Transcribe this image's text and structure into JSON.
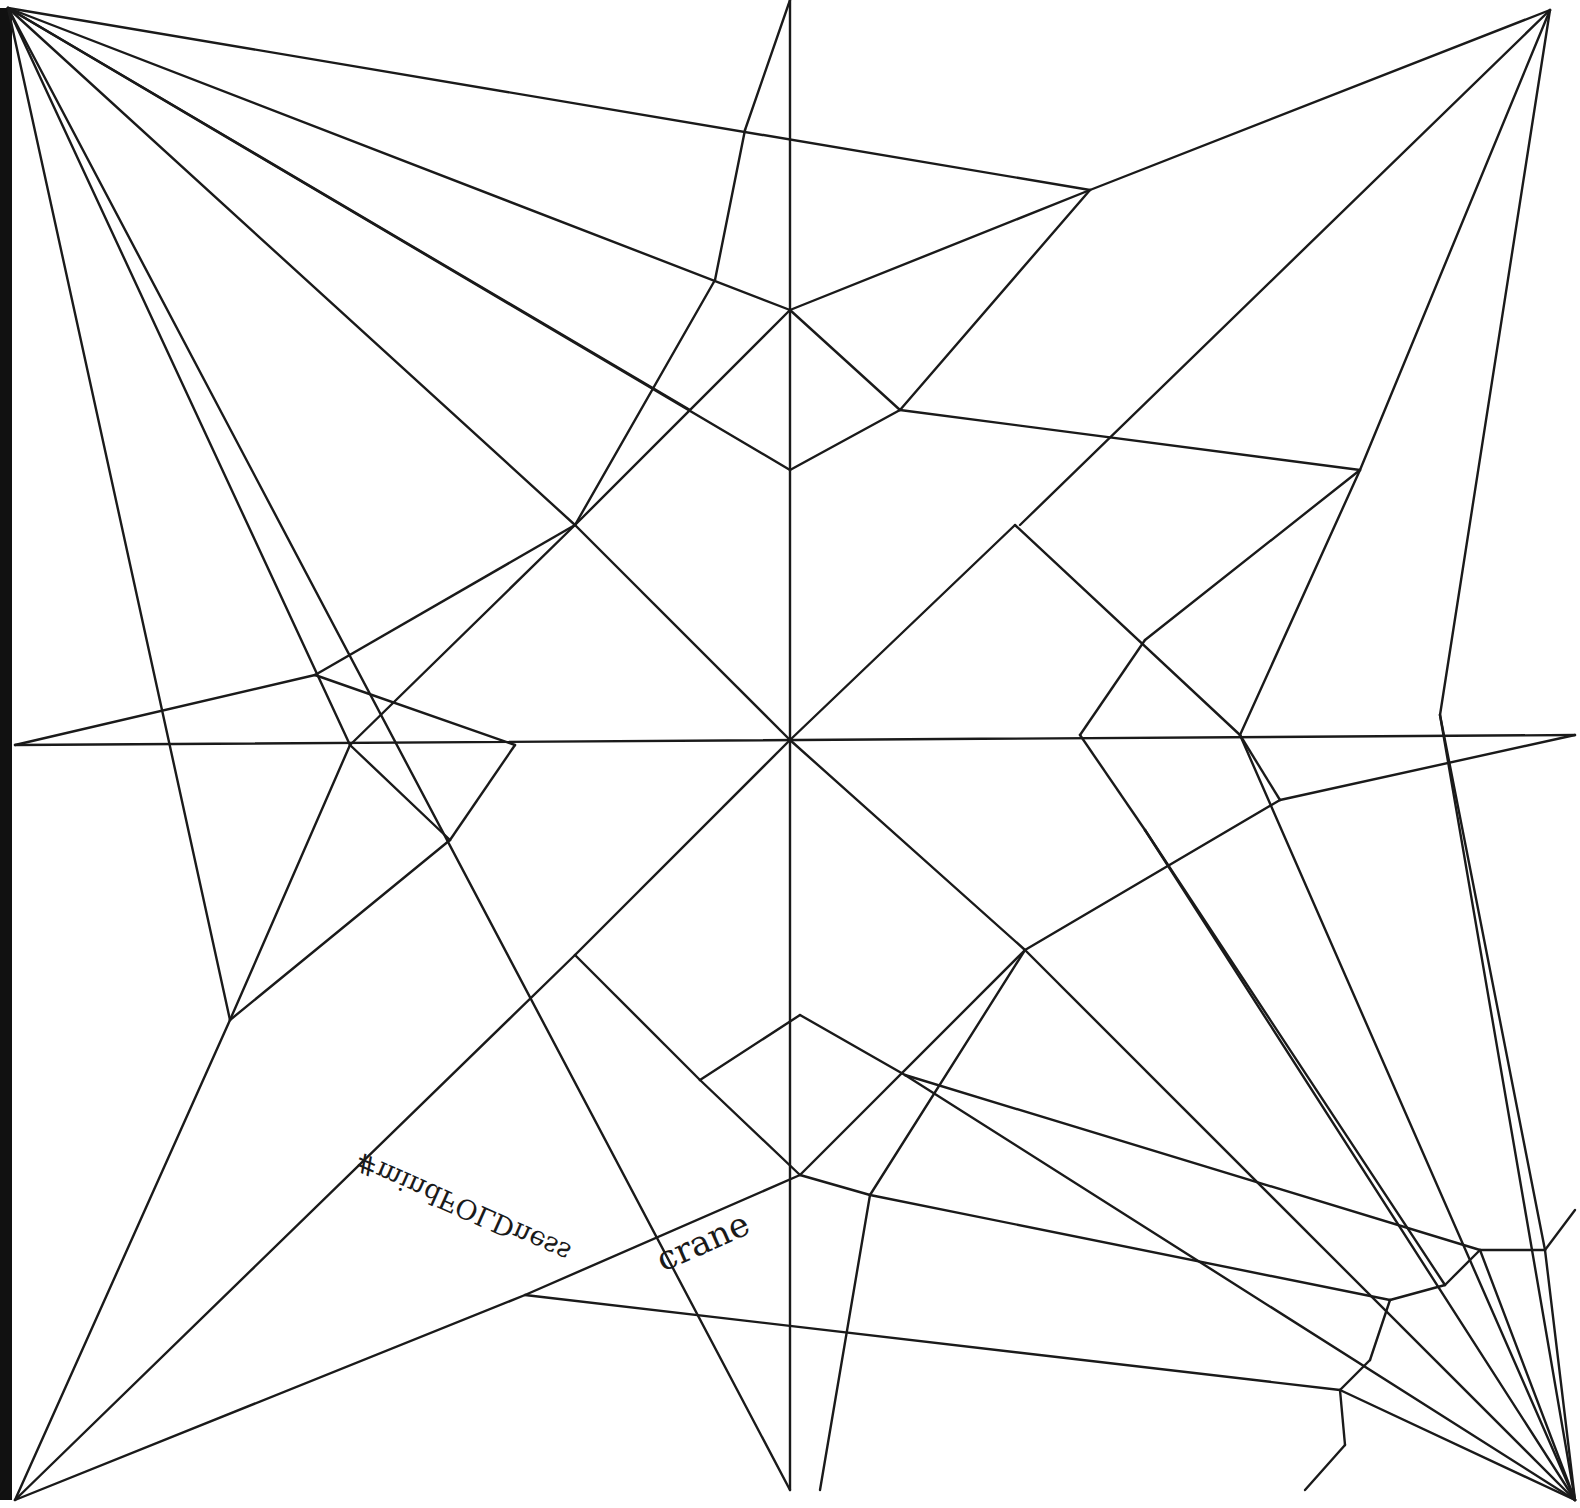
{
  "diagram": {
    "type": "origami-crease-pattern",
    "subject": "crane",
    "labels": {
      "hashtag": "#mindFOLDness",
      "model_name": "crane"
    },
    "colors": {
      "line": "#1a1a1a",
      "background": "#ffffff",
      "edge": "#111111"
    },
    "segments": [
      [
        8,
        8,
        790,
        1490
      ],
      [
        790,
        1490,
        790,
        0
      ],
      [
        8,
        8,
        1090,
        190
      ],
      [
        1090,
        190,
        1550,
        10
      ],
      [
        8,
        8,
        790,
        310
      ],
      [
        8,
        8,
        575,
        525
      ],
      [
        8,
        8,
        230,
        1020
      ],
      [
        8,
        8,
        350,
        745
      ],
      [
        8,
        8,
        690,
        410
      ],
      [
        8,
        8,
        790,
        470
      ],
      [
        790,
        0,
        745,
        130
      ],
      [
        745,
        130,
        715,
        280
      ],
      [
        715,
        280,
        575,
        525
      ],
      [
        575,
        525,
        315,
        675
      ],
      [
        315,
        675,
        15,
        745
      ],
      [
        1090,
        190,
        790,
        310
      ],
      [
        1090,
        190,
        900,
        410
      ],
      [
        790,
        310,
        575,
        525
      ],
      [
        790,
        310,
        900,
        410
      ],
      [
        790,
        470,
        900,
        410
      ],
      [
        900,
        410,
        1360,
        470
      ],
      [
        1550,
        10,
        1020,
        525
      ],
      [
        1550,
        10,
        1360,
        470
      ],
      [
        1550,
        10,
        1440,
        715
      ],
      [
        15,
        745,
        1575,
        735
      ],
      [
        575,
        525,
        790,
        740
      ],
      [
        790,
        740,
        1015,
        525
      ],
      [
        1015,
        525,
        1240,
        735
      ],
      [
        350,
        745,
        575,
        525
      ],
      [
        350,
        745,
        450,
        840
      ],
      [
        450,
        840,
        515,
        745
      ],
      [
        515,
        745,
        315,
        675
      ],
      [
        350,
        745,
        230,
        1020
      ],
      [
        230,
        1020,
        450,
        840
      ],
      [
        790,
        740,
        575,
        955
      ],
      [
        790,
        740,
        1025,
        950
      ],
      [
        1360,
        470,
        1145,
        640
      ],
      [
        1145,
        640,
        1080,
        735
      ],
      [
        1080,
        735,
        1145,
        830
      ],
      [
        1360,
        470,
        1240,
        735
      ],
      [
        1240,
        735,
        1280,
        800
      ],
      [
        1280,
        800,
        1575,
        735
      ],
      [
        1280,
        800,
        1025,
        950
      ],
      [
        1025,
        950,
        870,
        1195
      ],
      [
        870,
        1195,
        820,
        1490
      ],
      [
        1440,
        715,
        1545,
        1250
      ],
      [
        1545,
        1250,
        1575,
        1210
      ],
      [
        1145,
        830,
        1445,
        1285
      ],
      [
        1445,
        1285,
        1480,
        1250
      ],
      [
        1480,
        1250,
        1545,
        1250
      ],
      [
        230,
        1020,
        15,
        1500
      ],
      [
        15,
        1500,
        525,
        1295
      ],
      [
        525,
        1295,
        800,
        1175
      ],
      [
        15,
        1500,
        575,
        955
      ],
      [
        575,
        955,
        700,
        1080
      ],
      [
        700,
        1080,
        800,
        1015
      ],
      [
        800,
        1015,
        905,
        1075
      ],
      [
        700,
        1080,
        800,
        1175
      ],
      [
        800,
        1175,
        1025,
        950
      ],
      [
        800,
        1175,
        870,
        1195
      ],
      [
        870,
        1195,
        1390,
        1300
      ],
      [
        525,
        1295,
        1340,
        1390
      ],
      [
        1340,
        1390,
        1575,
        1500
      ],
      [
        905,
        1075,
        1575,
        1500
      ],
      [
        1025,
        950,
        1575,
        1500
      ],
      [
        1145,
        830,
        1575,
        1500
      ],
      [
        1240,
        735,
        1575,
        1500
      ],
      [
        1440,
        715,
        1575,
        1500
      ],
      [
        1545,
        1250,
        1575,
        1500
      ],
      [
        1390,
        1300,
        1445,
        1285
      ],
      [
        1390,
        1300,
        1370,
        1360
      ],
      [
        1370,
        1360,
        1340,
        1390
      ],
      [
        1340,
        1390,
        1345,
        1445
      ],
      [
        1345,
        1445,
        1305,
        1490
      ],
      [
        905,
        1075,
        1480,
        1250
      ],
      [
        1480,
        1250,
        1575,
        1500
      ]
    ]
  }
}
